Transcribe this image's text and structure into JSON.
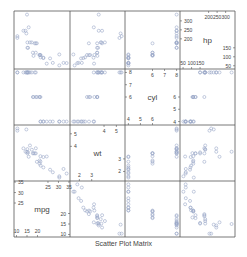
{
  "chart_data": {
    "type": "scatter",
    "subtype": "scatterplot-matrix",
    "title": "Scatter Plot Matrix",
    "variables": [
      "mpg",
      "wt",
      "cyl",
      "hp"
    ],
    "diagonal_order_bottom_left_to_top_right": [
      "mpg",
      "wt",
      "cyl",
      "hp"
    ],
    "axis_ranges": {
      "mpg": [
        8.8,
        35.5
      ],
      "wt": [
        1.24,
        5.7
      ],
      "cyl": [
        3.72,
        8.28
      ],
      "hp": [
        32,
        355
      ]
    },
    "diagonal_ticks": {
      "mpg": {
        "low": [
          10,
          15,
          20
        ],
        "high": [
          25,
          30,
          35
        ]
      },
      "wt": {
        "low": [
          2,
          3
        ],
        "high": [
          4,
          5
        ]
      },
      "cyl": {
        "low": [
          4,
          5,
          6
        ],
        "high": [
          6,
          7,
          8
        ]
      },
      "hp": {
        "low": [
          50,
          100,
          150
        ],
        "high": [
          200,
          250,
          300
        ]
      }
    },
    "observations": {
      "mpg": [
        21.0,
        21.0,
        22.8,
        21.4,
        18.7,
        18.1,
        14.3,
        24.4,
        22.8,
        19.2,
        17.8,
        16.4,
        17.3,
        15.2,
        10.4,
        10.4,
        14.7,
        32.4,
        30.4,
        33.9,
        21.5,
        15.5,
        15.2,
        13.3,
        19.2,
        27.3,
        26.0,
        30.4,
        15.8,
        19.7,
        15.0,
        21.4
      ],
      "cyl": [
        6,
        6,
        4,
        6,
        8,
        6,
        8,
        4,
        4,
        6,
        6,
        8,
        8,
        8,
        8,
        8,
        8,
        4,
        4,
        4,
        4,
        8,
        8,
        8,
        8,
        4,
        4,
        4,
        8,
        6,
        8,
        4
      ],
      "wt": [
        2.62,
        2.875,
        2.32,
        3.215,
        3.44,
        3.46,
        3.57,
        3.19,
        3.15,
        3.44,
        3.44,
        4.07,
        3.73,
        3.78,
        5.25,
        5.424,
        5.345,
        2.2,
        1.615,
        1.835,
        2.465,
        3.52,
        3.435,
        3.84,
        3.845,
        1.935,
        2.14,
        1.513,
        3.17,
        2.77,
        3.57,
        2.78
      ],
      "hp": [
        110,
        110,
        93,
        110,
        175,
        105,
        245,
        62,
        95,
        123,
        123,
        180,
        180,
        180,
        205,
        215,
        230,
        66,
        52,
        65,
        97,
        150,
        150,
        245,
        175,
        66,
        91,
        113,
        264,
        175,
        335,
        109
      ]
    },
    "marker": {
      "shape": "open-circle",
      "color": "#9aa8c8"
    },
    "grid": false,
    "legend": "none"
  },
  "labels": {
    "title": "Scatter Plot Matrix"
  },
  "colors": {
    "frame": "#555555",
    "text": "#444444",
    "point": "#9aa8c8"
  }
}
